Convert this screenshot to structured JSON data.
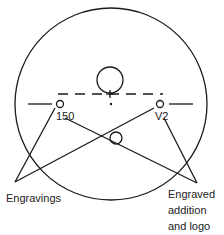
{
  "diagram": {
    "stroke_color": "#1a1a1a",
    "lens_outline": {
      "cx": 111,
      "cy": 104,
      "r": 96
    },
    "top_circle": {
      "cx": 110,
      "cy": 80,
      "r": 13
    },
    "bottom_circle": {
      "cx": 116,
      "cy": 138,
      "r": 6
    },
    "left_marker": {
      "cx": 60,
      "cy": 104,
      "r": 3.5
    },
    "right_marker": {
      "cx": 160,
      "cy": 104,
      "r": 3.5
    },
    "labels": {
      "left_engraving": "150",
      "right_engraving": "V2",
      "engravings": "Engravings",
      "engraved_line1": "Engraved",
      "engraved_line2": "addition",
      "engraved_line3": "and logo"
    }
  }
}
